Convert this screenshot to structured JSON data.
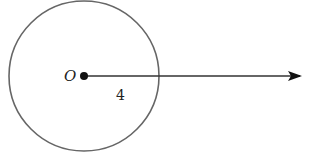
{
  "diagram": {
    "type": "circle-with-ray",
    "circle": {
      "cx": 84,
      "cy": 76,
      "r": 75,
      "stroke": "#666666"
    },
    "center": {
      "label": "O",
      "x": 84,
      "y": 76
    },
    "ray": {
      "x1": 84,
      "y1": 76,
      "x2": 300,
      "y2": 76,
      "color": "#333333"
    },
    "radius_label": "4"
  }
}
